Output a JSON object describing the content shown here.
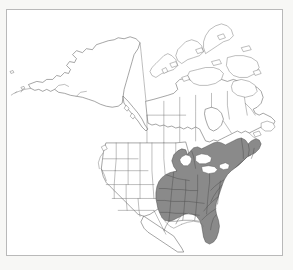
{
  "figure": {
    "title": "North America Range Map",
    "description": "Outline map of North America showing species distribution shaded in the eastern United States",
    "frame": {
      "border_color": "#b9b9b9",
      "background_color": "#ffffff"
    },
    "page_background": "#f7f7f5"
  },
  "map": {
    "projection_note": "North America, Alaska through Atlantic Canada and the contiguous United States",
    "outline_color": "#5a5a5a",
    "internal_border_color": "#6e6e6e",
    "land_fill": "#ffffff",
    "regions": [
      {
        "name": "alaska",
        "label": "Alaska",
        "shaded": false
      },
      {
        "name": "canada",
        "label": "Canada",
        "shaded": false
      },
      {
        "name": "canadian-arctic-archipelago",
        "label": "Canadian Arctic Archipelago",
        "shaded": false
      },
      {
        "name": "contiguous-united-states",
        "label": "Contiguous United States",
        "shaded": false
      },
      {
        "name": "mexico-northern",
        "label": "Northern Mexico",
        "shaded": false
      }
    ]
  },
  "range": {
    "legend_label": "Distribution range",
    "fill_color": "#8a8a8a",
    "outline_color": "#4a4a4a",
    "coverage_description": "Eastern United States from the Great Lakes and New England south to Florida and the Gulf Coast, west to the eastern Great Plains",
    "states_shaded": [
      "Maine",
      "New Hampshire",
      "Vermont",
      "Massachusetts",
      "Rhode Island",
      "Connecticut",
      "New York",
      "New Jersey",
      "Pennsylvania",
      "Delaware",
      "Maryland",
      "Virginia",
      "West Virginia",
      "Ohio",
      "Michigan",
      "Indiana",
      "Illinois",
      "Wisconsin",
      "Kentucky",
      "Tennessee",
      "North Carolina",
      "South Carolina",
      "Georgia",
      "Florida",
      "Alabama",
      "Mississippi",
      "Louisiana",
      "Arkansas",
      "Missouri",
      "Iowa",
      "eastern Texas",
      "eastern Oklahoma",
      "eastern Kansas",
      "southeastern Minnesota"
    ],
    "states_unshaded": [
      "Washington",
      "Oregon",
      "California",
      "Idaho",
      "Nevada",
      "Utah",
      "Arizona",
      "Montana",
      "Wyoming",
      "Colorado",
      "New Mexico",
      "North Dakota",
      "South Dakota",
      "Nebraska",
      "western Texas",
      "western Kansas",
      "western Oklahoma",
      "western Minnesota"
    ]
  }
}
